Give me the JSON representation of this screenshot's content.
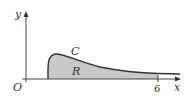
{
  "diagram": {
    "labels": {
      "y_axis": "y",
      "x_axis": "x",
      "origin": "O",
      "curve": "C",
      "region": "R",
      "x_tick": "6"
    },
    "colors": {
      "axis": "#333333",
      "curve": "#333333",
      "region_fill": "#c8c8c8",
      "background": "#ffffff"
    },
    "geometry": {
      "curve_start_x": 48,
      "tick_x": 158
    }
  }
}
